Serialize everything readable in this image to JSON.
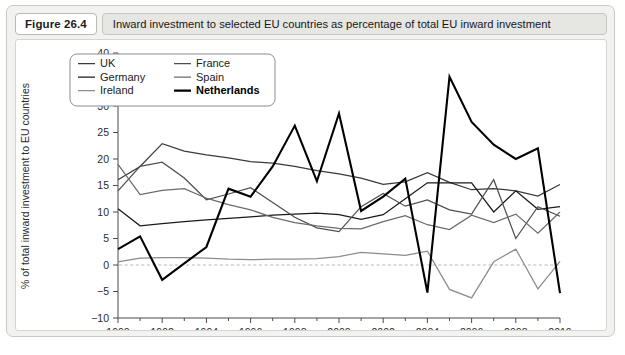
{
  "figure": {
    "number_label": "Figure 26.4",
    "caption": "Inward investment to selected EU countries as percentage of total EU inward investment"
  },
  "chart_data": {
    "type": "line",
    "title": "Inward investment to selected EU countries as percentage of total EU inward investment",
    "xlabel": "",
    "ylabel": "% of total inward investment to EU countries",
    "xlim": [
      1990,
      2010
    ],
    "ylim": [
      -10,
      40
    ],
    "yticks": [
      -10,
      -5,
      0,
      5,
      10,
      15,
      20,
      25,
      30,
      35,
      40
    ],
    "ytick_labels": [
      "-10",
      "-5",
      "0",
      "5",
      "10",
      "15",
      "20",
      "25",
      "30",
      "35",
      "40"
    ],
    "xticks": [
      1990,
      1992,
      1994,
      1996,
      1998,
      2000,
      2002,
      2004,
      2006,
      2008,
      2010
    ],
    "xtick_labels": [
      "1990",
      "1992",
      "1994",
      "1996",
      "1998",
      "2000",
      "2002",
      "2004",
      "2006",
      "2008",
      "2010"
    ],
    "x": [
      1990,
      1991,
      1992,
      1993,
      1994,
      1995,
      1996,
      1997,
      1998,
      1999,
      2000,
      2001,
      2002,
      2003,
      2004,
      2005,
      2006,
      2007,
      2008,
      2009,
      2010
    ],
    "grid": false,
    "zero_reference_line": true,
    "legend_position": "top-center",
    "series": [
      {
        "name": "UK",
        "color": "#3a3a3a",
        "width": 1.25,
        "values": [
          16.1,
          18.6,
          22.9,
          21.5,
          20.8,
          20.2,
          19.5,
          19.2,
          18.6,
          17.8,
          17.2,
          16.4,
          15.2,
          15.7,
          17.4,
          15.6,
          14.2,
          14.4,
          14.0,
          13.0,
          15.2
        ]
      },
      {
        "name": "Germany",
        "color": "#1a1a1a",
        "width": 1.25,
        "values": [
          10.6,
          7.4,
          7.8,
          8.2,
          8.5,
          8.8,
          9.1,
          9.4,
          9.6,
          9.8,
          9.5,
          8.6,
          9.5,
          12.5,
          15.5,
          15.5,
          15.5,
          10.0,
          14.0,
          10.5,
          11.0
        ]
      },
      {
        "name": "Ireland",
        "color": "#8c8c8c",
        "width": 1.25,
        "values": [
          0.6,
          1.3,
          1.4,
          1.4,
          1.3,
          1.1,
          1.0,
          1.1,
          1.1,
          1.2,
          1.6,
          2.4,
          2.1,
          1.8,
          2.6,
          -4.6,
          -6.2,
          0.6,
          3.0,
          -4.5,
          0.7
        ]
      },
      {
        "name": "France",
        "color": "#4f4f4f",
        "width": 1.25,
        "values": [
          14.0,
          18.6,
          19.4,
          16.4,
          12.3,
          13.4,
          14.6,
          11.8,
          9.0,
          7.0,
          6.3,
          11.0,
          13.5,
          11.1,
          12.3,
          10.4,
          9.6,
          16.1,
          5.0,
          11.0,
          9.2
        ]
      },
      {
        "name": "Spain",
        "color": "#6b6b6b",
        "width": 1.25,
        "values": [
          19.0,
          13.3,
          14.1,
          14.4,
          12.6,
          11.4,
          10.4,
          9.0,
          8.0,
          7.4,
          6.9,
          6.8,
          8.2,
          9.3,
          7.6,
          6.7,
          9.4,
          8.0,
          9.6,
          6.0,
          10.0
        ]
      },
      {
        "name": "Netherlands",
        "color": "#000000",
        "width": 2.1,
        "values": [
          3.0,
          5.4,
          -2.8,
          0.3,
          3.4,
          14.4,
          12.9,
          18.6,
          26.3,
          15.8,
          28.6,
          10.2,
          12.9,
          16.3,
          -5.2,
          35.5,
          27.0,
          22.7,
          20.0,
          22.0,
          -5.3
        ]
      }
    ]
  }
}
